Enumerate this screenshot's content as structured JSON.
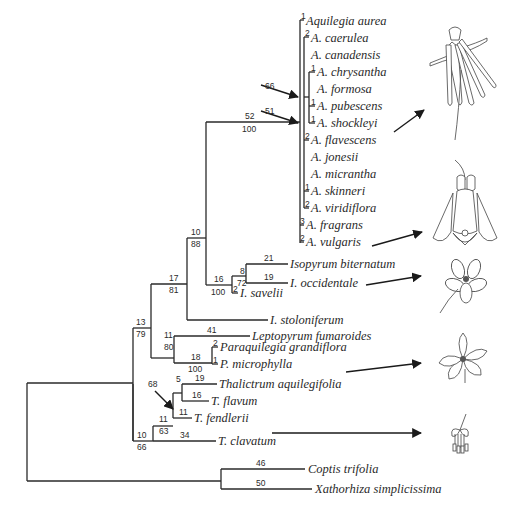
{
  "figure": {
    "type": "phylogenetic-tree"
  },
  "taxa": [
    {
      "id": "aurea",
      "label": "Aquilegia aurea",
      "x": 306,
      "y": 21,
      "branch_len": "1"
    },
    {
      "id": "caerulea",
      "label": "A. caerulea",
      "x": 311,
      "y": 38,
      "branch_len": "2"
    },
    {
      "id": "canadensis",
      "label": "A. canadensis",
      "x": 311,
      "y": 55,
      "branch_len": ""
    },
    {
      "id": "chrysantha",
      "label": "A. chrysantha",
      "x": 317,
      "y": 72,
      "branch_len": "1"
    },
    {
      "id": "formosa",
      "label": "A. formosa",
      "x": 317,
      "y": 89,
      "branch_len": ""
    },
    {
      "id": "pubescens",
      "label": "A. pubescens",
      "x": 317,
      "y": 106,
      "branch_len": "1"
    },
    {
      "id": "shockleyi",
      "label": "A. shockleyi",
      "x": 317,
      "y": 123,
      "branch_len": "1"
    },
    {
      "id": "flavescens",
      "label": "A. flavescens",
      "x": 311,
      "y": 140,
      "branch_len": "2"
    },
    {
      "id": "jonesii",
      "label": "A. jonesii",
      "x": 311,
      "y": 157,
      "branch_len": ""
    },
    {
      "id": "micrantha",
      "label": "A. micrantha",
      "x": 311,
      "y": 174,
      "branch_len": ""
    },
    {
      "id": "skinneri",
      "label": "A. skinneri",
      "x": 311,
      "y": 191,
      "branch_len": "1"
    },
    {
      "id": "viridiflora",
      "label": "A. viridiflora",
      "x": 311,
      "y": 208,
      "branch_len": "2"
    },
    {
      "id": "fragrans",
      "label": "A. fragrans",
      "x": 306,
      "y": 225,
      "branch_len": "3"
    },
    {
      "id": "vulgaris",
      "label": "A. vulgaris",
      "x": 306,
      "y": 242,
      "branch_len": "2"
    },
    {
      "id": "biternatum",
      "label": "Isopyrum biternatum",
      "x": 290,
      "y": 259,
      "branch_len": "21"
    },
    {
      "id": "occidentale",
      "label": "I. occidentale",
      "x": 290,
      "y": 276,
      "branch_len": "19"
    },
    {
      "id": "savelii",
      "label": "I. savelii",
      "x": 240,
      "y": 293,
      "branch_len": "2"
    },
    {
      "id": "stoloniferum",
      "label": "I. stoloniferum",
      "x": 270,
      "y": 312,
      "branch_len": ""
    },
    {
      "id": "fumaroides",
      "label": "Leptopyrum fumaroides",
      "x": 252,
      "y": 330,
      "branch_len": "41"
    },
    {
      "id": "grandiflora",
      "label": "Paraquilegia grandiflora",
      "x": 220,
      "y": 347,
      "branch_len": "2"
    },
    {
      "id": "microphylla",
      "label": "P. microphylla",
      "x": 220,
      "y": 364,
      "branch_len": "1"
    },
    {
      "id": "aquilegifolia",
      "label": "Thalictrum aquilegifolia",
      "x": 219,
      "y": 381,
      "branch_len": "19"
    },
    {
      "id": "flavum",
      "label": "T. flavum",
      "x": 211,
      "y": 397,
      "branch_len": "16"
    },
    {
      "id": "fendlerii",
      "label": "T. fendlerii",
      "x": 194,
      "y": 414,
      "branch_len": "11"
    },
    {
      "id": "clavatum",
      "label": "T. clavatum",
      "x": 218,
      "y": 431,
      "branch_len": "34"
    },
    {
      "id": "trifolia",
      "label": "Coptis trifolia",
      "x": 308,
      "y": 472,
      "branch_len": "46"
    },
    {
      "id": "simplicissima",
      "label": "Xathorhiza simplicissima",
      "x": 315,
      "y": 490,
      "branch_len": "50"
    }
  ],
  "nodes": [
    {
      "id": "aquilegia",
      "above": "52",
      "below": "100",
      "x": 302,
      "y": 122
    },
    {
      "id": "arrow66",
      "label": "66",
      "x": 243,
      "y": 71
    },
    {
      "id": "arrow51",
      "label": "51",
      "x": 243,
      "y": 97
    },
    {
      "id": "isopyrum_pair",
      "above": "8",
      "below": "72",
      "x": 238,
      "y": 272
    },
    {
      "id": "isopyrum",
      "above": "16",
      "below": "100",
      "x": 212,
      "y": 293
    },
    {
      "id": "aq_iso",
      "above": "10",
      "below": "88",
      "x": 188,
      "y": 238
    },
    {
      "id": "aq_iso_stol",
      "above": "17",
      "below": "81",
      "x": 157,
      "y": 284
    },
    {
      "id": "paraquilegia",
      "above": "18",
      "below": "100",
      "x": 180,
      "y": 359
    },
    {
      "id": "lepto_para",
      "above": "11",
      "below": "80",
      "x": 162,
      "y": 337
    },
    {
      "id": "main_upper",
      "above": "13",
      "below": "79",
      "x": 133,
      "y": 328
    },
    {
      "id": "thal_pair",
      "above": "5",
      "below": "",
      "x": 183,
      "y": 387
    },
    {
      "id": "arrow68",
      "label": "68",
      "x": 148,
      "y": 382
    },
    {
      "id": "thal_three",
      "above": "11",
      "below": "63",
      "x": 167,
      "y": 403
    },
    {
      "id": "thalictrum",
      "above": "10",
      "below": "66",
      "x": 147,
      "y": 418
    },
    {
      "id": "root",
      "above": "",
      "below": "",
      "x": 27,
      "y": 383
    }
  ],
  "illustrations": [
    {
      "id": "flower-aquilegia-spurred",
      "caption": "Aquilegia (long-spurred)"
    },
    {
      "id": "flower-aquilegia-nodding",
      "caption": "Aquilegia (nodding)"
    },
    {
      "id": "flower-isopyrum",
      "caption": "Isopyrum"
    },
    {
      "id": "flower-paraquilegia",
      "caption": "Paraquilegia"
    },
    {
      "id": "flower-thalictrum",
      "caption": "Thalictrum"
    }
  ],
  "colors": {
    "ink": "#2a2a2a",
    "background": "#ffffff"
  }
}
